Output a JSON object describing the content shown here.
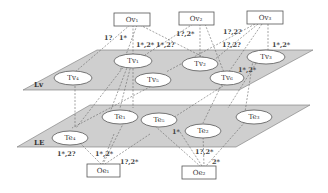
{
  "diagram": {
    "planes": {
      "upper": {
        "label": "Lv"
      },
      "lower": {
        "label": "LE"
      }
    },
    "top_boxes": [
      {
        "id": "Ov1",
        "label": "Ov₁"
      },
      {
        "id": "Ov2",
        "label": "Ov₂"
      },
      {
        "id": "Ov3",
        "label": "Ov₃"
      }
    ],
    "bottom_boxes": [
      {
        "id": "Oe1",
        "label": "Oe₁"
      },
      {
        "id": "Oe2",
        "label": "Oe₂"
      }
    ],
    "upper_nodes": [
      {
        "id": "Tv1",
        "label": "Tv₁"
      },
      {
        "id": "Tv2",
        "label": "Tv₂"
      },
      {
        "id": "Tv3",
        "label": "Tv₃"
      },
      {
        "id": "Tv4",
        "label": "Tv₄"
      },
      {
        "id": "Tv5",
        "label": "Tv₅"
      },
      {
        "id": "Tv6",
        "label": "Tv₆"
      }
    ],
    "lower_nodes": [
      {
        "id": "Te1",
        "label": "Te₁"
      },
      {
        "id": "Te2",
        "label": "Te₂"
      },
      {
        "id": "Te3",
        "label": "Te₃"
      },
      {
        "id": "Te4",
        "label": "Te₄"
      },
      {
        "id": "Te5",
        "label": "Te₅"
      }
    ],
    "edge_labels": {
      "ov1_a": "1?",
      "ov1_b": "1*",
      "ov1_tv1": "1*,2*",
      "ov1_ov2": "1*,2?",
      "ov2_tv2": "1?,2*",
      "ov3_a": "1?,2?",
      "ov3_b": "1?,2?",
      "ov3_tv3": "1*,2*",
      "tv6": "1*,2*",
      "te5": "1*",
      "oe1_a": "1*,2?",
      "oe1_b": "1*,2*",
      "oe1_c": "1?,2*",
      "oe2_a": "1?,2*",
      "oe2_b": "2*"
    }
  }
}
